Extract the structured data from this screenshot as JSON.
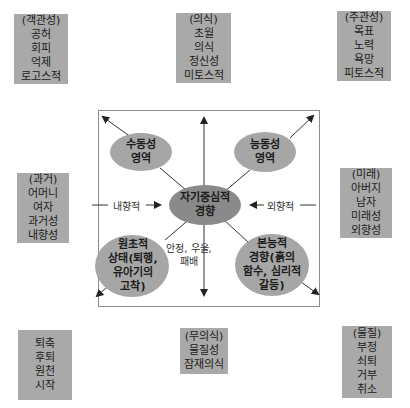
{
  "cards": {
    "top_left": {
      "lines": [
        "(객관성)",
        "공허",
        "회피",
        "억제",
        "로고스적"
      ]
    },
    "top_center": {
      "lines": [
        "(의식)",
        "초월",
        "의식",
        "정신성",
        "미토스적"
      ]
    },
    "top_right": {
      "lines": [
        "(주관성)",
        "목표",
        "노력",
        "욕망",
        "피토스적"
      ]
    },
    "mid_left": {
      "lines": [
        "(과거)",
        "어머니",
        "여자",
        "과거성",
        "내향성"
      ]
    },
    "mid_right": {
      "lines": [
        "(미래)",
        "아버지",
        "남자",
        "미래성",
        "외향성"
      ]
    },
    "bottom_left": {
      "lines": [
        "퇴축",
        "후퇴",
        "원천",
        "시작"
      ]
    },
    "bottom_center": {
      "lines": [
        "(무의식)",
        "물질성",
        "잠재의식"
      ]
    },
    "bottom_right": {
      "lines": [
        "(물질)",
        "부정",
        "쇠퇴",
        "거부",
        "취소"
      ]
    }
  },
  "ellipses": {
    "passive": {
      "lines": [
        "수동성",
        "영역"
      ]
    },
    "active": {
      "lines": [
        "능동성",
        "영역"
      ]
    },
    "center": {
      "lines": [
        "자기중심적",
        "경향"
      ]
    },
    "primitive": {
      "lines": [
        "원초적",
        "상태(퇴행,",
        "유아기의",
        "고착)"
      ]
    },
    "instinctive": {
      "lines": [
        "본능적",
        "경향(흙의",
        "함수, 심리적",
        "갈등)"
      ]
    }
  },
  "labels": {
    "inward": "내향적",
    "outward": "외향적",
    "bottom_middle": [
      "안정, 우울,",
      "패배"
    ]
  },
  "colors": {
    "card_bg": "#a9a9a9",
    "ellipse_light": "#a6a6a6",
    "ellipse_dark": "#8a8a8a",
    "box_border": "#8c8c8c",
    "line": "#333333"
  }
}
